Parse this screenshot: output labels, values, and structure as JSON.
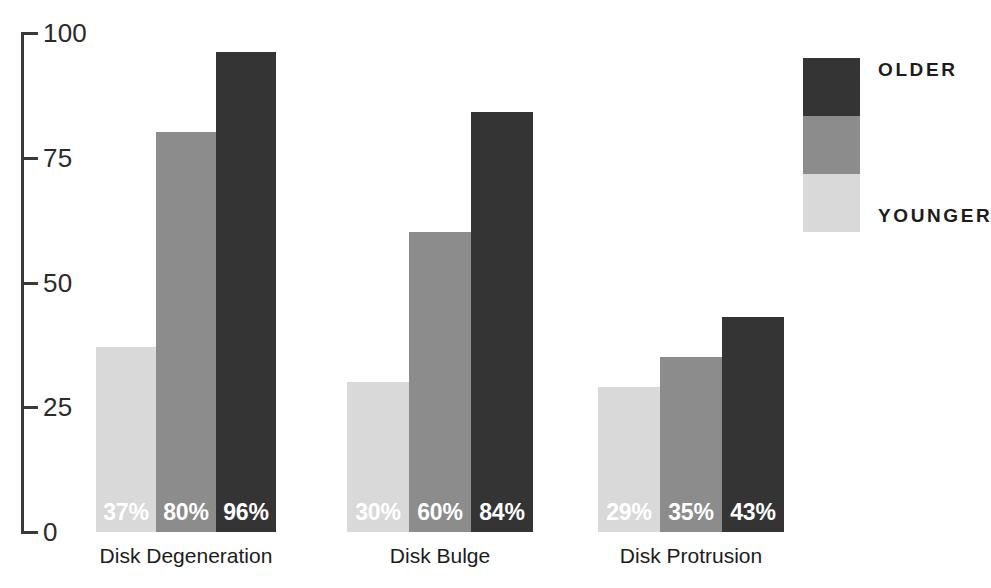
{
  "chart_data": {
    "type": "bar",
    "title": "",
    "subtitle": "",
    "xlabel": "",
    "ylabel": "",
    "ylim": [
      0,
      100
    ],
    "yticks": [
      "0",
      "25",
      "50",
      "75",
      "100"
    ],
    "grid": false,
    "legend_position": "right",
    "categories": [
      "Disk Degeneration",
      "Disk Bulge",
      "Disk Protrusion"
    ],
    "series": [
      {
        "name": "YOUNGER",
        "color": "#d9d9d9",
        "values": [
          37,
          30,
          29
        ],
        "labels": [
          "37%",
          "30%",
          "29%"
        ]
      },
      {
        "name": "MIDDLE",
        "color": "#8c8c8c",
        "values": [
          80,
          60,
          35
        ],
        "labels": [
          "80%",
          "60%",
          "35%"
        ]
      },
      {
        "name": "OLDER",
        "color": "#343434",
        "values": [
          96,
          84,
          43
        ],
        "labels": [
          "96%",
          "84%",
          "43%"
        ]
      }
    ]
  },
  "axis": {
    "ticks": [
      {
        "value": "100",
        "y": 33
      },
      {
        "value": "75",
        "y": 158
      },
      {
        "value": "50",
        "y": 283
      },
      {
        "value": "25",
        "y": 407
      },
      {
        "value": "0",
        "y": 532
      }
    ],
    "line_color": "#3a3a3a"
  },
  "groups": [
    {
      "label": "Disk Degeneration",
      "label_left": 86,
      "label_width": 200,
      "bars": [
        {
          "series": "YOUNGER",
          "label": "37%",
          "value": 37,
          "left": 96,
          "width": 60,
          "height": 185,
          "color": "#d9d9d9"
        },
        {
          "series": "MIDDLE",
          "label": "80%",
          "value": 80,
          "left": 156,
          "width": 60,
          "height": 400,
          "color": "#8c8c8c"
        },
        {
          "series": "OLDER",
          "label": "96%",
          "value": 96,
          "left": 216,
          "width": 60,
          "height": 480,
          "color": "#343434"
        }
      ]
    },
    {
      "label": "Disk Bulge",
      "label_left": 340,
      "label_width": 200,
      "bars": [
        {
          "series": "YOUNGER",
          "label": "30%",
          "value": 30,
          "left": 347,
          "width": 62,
          "height": 150,
          "color": "#d9d9d9"
        },
        {
          "series": "MIDDLE",
          "label": "60%",
          "value": 60,
          "left": 409,
          "width": 62,
          "height": 300,
          "color": "#8c8c8c"
        },
        {
          "series": "OLDER",
          "label": "84%",
          "value": 84,
          "left": 471,
          "width": 62,
          "height": 420,
          "color": "#343434"
        }
      ]
    },
    {
      "label": "Disk Protrusion",
      "label_left": 591,
      "label_width": 200,
      "bars": [
        {
          "series": "YOUNGER",
          "label": "29%",
          "value": 29,
          "left": 598,
          "width": 62,
          "height": 145,
          "color": "#d9d9d9"
        },
        {
          "series": "MIDDLE",
          "label": "35%",
          "value": 35,
          "left": 660,
          "width": 62,
          "height": 175,
          "color": "#8c8c8c"
        },
        {
          "series": "OLDER",
          "label": "43%",
          "value": 43,
          "left": 722,
          "width": 62,
          "height": 215,
          "color": "#343434"
        }
      ]
    }
  ],
  "legend": {
    "swatches": [
      {
        "name": "OLDER",
        "color": "#343434",
        "top": 0
      },
      {
        "name": "MIDDLE",
        "color": "#8c8c8c",
        "top": 58
      },
      {
        "name": "YOUNGER",
        "color": "#d9d9d9",
        "top": 116
      }
    ],
    "top_label": "OLDER",
    "bottom_label": "YOUNGER",
    "top_label_y": 2,
    "bottom_label_y": 148
  }
}
